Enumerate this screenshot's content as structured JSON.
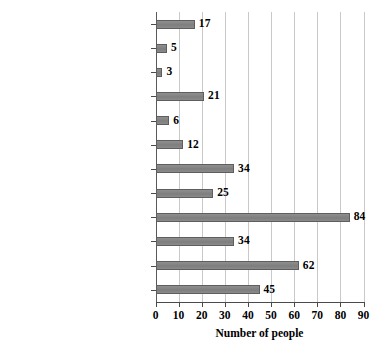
{
  "chart_data": {
    "type": "bar",
    "orientation": "horizontal",
    "title": "",
    "xlabel": "Number of people",
    "ylabel": "",
    "xlim": [
      0,
      90
    ],
    "xticks": [
      0,
      10,
      20,
      30,
      40,
      50,
      60,
      70,
      80,
      90
    ],
    "grid": "vertical",
    "legend": "none",
    "bar_color": "#858585",
    "bar_edge_color": "#5e5e5e",
    "gridline_color": "#c9c9c9",
    "axis_color": "#4a4a4a",
    "background_color": "#ffffff",
    "show_value_labels": true,
    "categories": [
      "Family",
      "Magazines",
      "Workplace",
      "Books",
      "Lectures at school",
      "Friends",
      "Dramas, movies",
      "Real-life experience",
      "Internet",
      "Newspaper",
      "News prorams on TV",
      "Variety programs on . . ."
    ],
    "values": [
      17,
      5,
      3,
      21,
      6,
      12,
      34,
      25,
      84,
      34,
      62,
      45
    ]
  }
}
